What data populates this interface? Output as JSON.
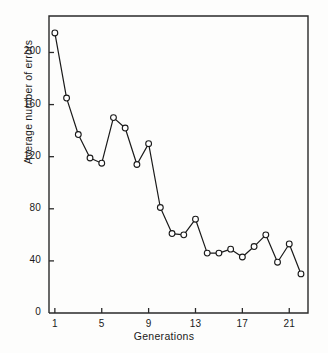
{
  "chart_data": {
    "type": "line",
    "title": "",
    "xlabel": "Generations",
    "ylabel": "Average number of errors",
    "x": [
      1,
      2,
      3,
      4,
      5,
      6,
      7,
      8,
      9,
      10,
      11,
      12,
      13,
      14,
      15,
      16,
      17,
      18,
      19,
      20,
      21,
      22
    ],
    "values": [
      215,
      165,
      137,
      119,
      115,
      150,
      142,
      114,
      130,
      81,
      61,
      60,
      72,
      46,
      46,
      49,
      43,
      51,
      60,
      39,
      53,
      30
    ],
    "series": [
      {
        "name": "Average number of errors",
        "values": [
          215,
          165,
          137,
          119,
          115,
          150,
          142,
          114,
          130,
          81,
          61,
          60,
          72,
          46,
          46,
          49,
          43,
          51,
          60,
          39,
          53,
          30
        ]
      }
    ],
    "xlim": [
      0.5,
      22.6
    ],
    "ylim": [
      0,
      228
    ],
    "xticks": [
      1,
      5,
      9,
      13,
      17,
      21
    ],
    "xtick_labels": [
      "1",
      "5",
      "9",
      "13",
      "17",
      "21"
    ],
    "yticks": [
      0,
      40,
      80,
      120,
      160,
      200
    ],
    "ytick_labels": [
      "0",
      "40",
      "80",
      "120",
      "160",
      "200"
    ],
    "grid": false,
    "legend": false,
    "marker": "open-circle",
    "line_color": "#1a1a1a",
    "marker_fill": "#ffffff",
    "background": "#fdfdfc"
  }
}
